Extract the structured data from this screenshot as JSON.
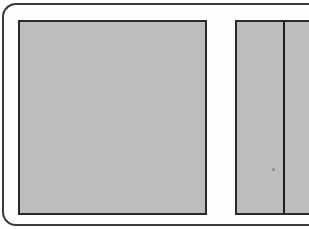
{
  "figure": {
    "colors": {
      "background": "#fefefe",
      "frame_stroke": "#3a3a3a",
      "panel_fill": "#bdbdbd",
      "panel_stroke": "#2a2a2a",
      "divider": "#1e1e1e"
    },
    "panels": [
      {
        "id": "left",
        "label": ""
      },
      {
        "id": "right",
        "label": "",
        "divided": true
      }
    ]
  }
}
